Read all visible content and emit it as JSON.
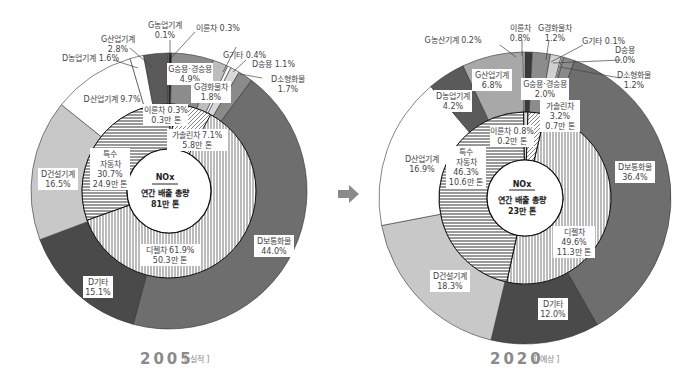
{
  "chart_data": [
    {
      "type": "pie",
      "subtype": "nested-donut",
      "title": "NOx 연간 배출 총량 81만 톤",
      "year_label": "2005",
      "year_tag": "[ 실적 ]",
      "center": {
        "pollutant": "NOx",
        "line1": "연간 배출 총량",
        "line2": "81만 톤"
      },
      "inner_ring": [
        {
          "name": "디젤차",
          "percent": 61.9,
          "amount": "50.3만 톤",
          "pattern": "vertical-stripes"
        },
        {
          "name": "특수 자동차",
          "percent": 30.7,
          "amount": "24.9만 톤",
          "pattern": "horizontal-stripes"
        },
        {
          "name": "이륜차",
          "percent": 0.3,
          "amount": "0.3만 톤",
          "pattern": "dots"
        },
        {
          "name": "가솔린차",
          "percent": 7.1,
          "amount": "5.8만 톤",
          "pattern": "diagonal-stripes"
        }
      ],
      "outer_ring": [
        {
          "name": "D보통화물",
          "percent": 44.0,
          "color": "#6e6e6e"
        },
        {
          "name": "D기타",
          "percent": 15.1,
          "color": "#4a4a4a"
        },
        {
          "name": "D건설기계",
          "percent": 16.5,
          "color": "#c8c8c8"
        },
        {
          "name": "D산업기계",
          "percent": 9.7,
          "color": "#ffffff"
        },
        {
          "name": "D농업기계",
          "percent": 1.6,
          "color": "#ffffff"
        },
        {
          "name": "G산업기계",
          "percent": 2.8,
          "color": "#5a5a5a"
        },
        {
          "name": "G농업기계",
          "percent": 0.1,
          "color": "#a0a0a0"
        },
        {
          "name": "이륜차",
          "percent": 0.3,
          "color": "#222222"
        },
        {
          "name": "G승용·경승용",
          "percent": 4.9,
          "color": "#8c8c8c"
        },
        {
          "name": "G경화물차",
          "percent": 1.8,
          "color": "#bdbdbd"
        },
        {
          "name": "G기타",
          "percent": 0.4,
          "color": "#ffffff"
        },
        {
          "name": "D승용",
          "percent": 1.1,
          "color": "#d8d8d8"
        },
        {
          "name": "D소형화물",
          "percent": 1.7,
          "color": "#8a8a8a"
        }
      ]
    },
    {
      "type": "pie",
      "subtype": "nested-donut",
      "title": "NOx 연간 배출 총량 23만 톤",
      "year_label": "2020",
      "year_tag": "[ 예상 ]",
      "center": {
        "pollutant": "NOx",
        "line1": "연간 배출 총량",
        "line2": "23만 톤"
      },
      "inner_ring": [
        {
          "name": "디젤차",
          "percent": 49.6,
          "amount": "11.3만 톤",
          "pattern": "vertical-stripes"
        },
        {
          "name": "특수 자동차",
          "percent": 46.3,
          "amount": "10.6만 톤",
          "pattern": "horizontal-stripes"
        },
        {
          "name": "이륜차",
          "percent": 0.8,
          "amount": "0.2만 톤",
          "pattern": "dots"
        },
        {
          "name": "가솔린차",
          "percent": 3.2,
          "amount": "0.7만 톤",
          "pattern": "diagonal-stripes"
        }
      ],
      "outer_ring": [
        {
          "name": "D보통화물",
          "percent": 36.4,
          "color": "#6e6e6e"
        },
        {
          "name": "D기타",
          "percent": 12.0,
          "color": "#4a4a4a"
        },
        {
          "name": "D건설기계",
          "percent": 18.3,
          "color": "#c8c8c8"
        },
        {
          "name": "D산업기계",
          "percent": 16.9,
          "color": "#ffffff"
        },
        {
          "name": "D농업기계",
          "percent": 4.2,
          "color": "#5a5a5a"
        },
        {
          "name": "G산업기계",
          "percent": 6.8,
          "color": "#a8a8a8"
        },
        {
          "name": "G농산기계",
          "percent": 0.2,
          "color": "#ffffff"
        },
        {
          "name": "이륜차",
          "percent": 0.8,
          "color": "#3a3a3a"
        },
        {
          "name": "G승용·경승용",
          "percent": 2.0,
          "color": "#8c8c8c"
        },
        {
          "name": "G경화물차",
          "percent": 1.2,
          "color": "#d0d0d0"
        },
        {
          "name": "G기타",
          "percent": 0.1,
          "color": "#ffffff"
        },
        {
          "name": "D승용",
          "percent": 0.0,
          "color": "#d8d8d8"
        },
        {
          "name": "D소형화물",
          "percent": 1.2,
          "color": "#8a8a8a"
        }
      ]
    }
  ],
  "labels2005": {
    "g_agri": [
      "G농업기계",
      "0.1%"
    ],
    "bike_top": "이륜차 0.3%",
    "g_ind": [
      "G산업기계",
      "2.8%"
    ],
    "d_agri": "D농업기계 1.6%",
    "g_car": [
      "G승용·경승용",
      "4.9%"
    ],
    "g_etc": "G기타 0.4%",
    "d_car": "D승용 1.1%",
    "d_small": [
      "D소형화물",
      "1.7%"
    ],
    "g_light": [
      "G경화물차",
      "1.8%"
    ],
    "d_ind": "D산업기계 9.7%",
    "bike_in": [
      "이륜차 0.3%",
      "0.3만 톤"
    ],
    "gas_in": [
      "가솔린차 7.1%",
      "5.8만 톤"
    ],
    "special": [
      "특수",
      "자동차",
      "30.7%",
      "24.9만 톤"
    ],
    "d_cons": [
      "D건설기계",
      "16.5%"
    ],
    "diesel": [
      "디젤차 61.9%",
      "50.3만 톤"
    ],
    "d_truck": [
      "D보통화물",
      "44.0%"
    ],
    "d_etc": [
      "D기타",
      "15.1%"
    ],
    "center": [
      "NOx",
      "연간 배출 총량",
      "81만 톤"
    ],
    "year": "2005",
    "tag": "[ 실적 ]"
  },
  "labels2020": {
    "g_agri": "G농산기계 0.2%",
    "bike_top": [
      "이륜차",
      "0.8%"
    ],
    "g_light": [
      "G경화물차",
      "1.2%"
    ],
    "g_etc": "G기타 0.1%",
    "d_car": [
      "D승용",
      "0.0%"
    ],
    "d_small": [
      "D소형화물",
      "1.2%"
    ],
    "g_ind": [
      "G산업기계",
      "6.8%"
    ],
    "g_car": [
      "G승용·경승용",
      "2.0%"
    ],
    "d_agri": [
      "D농업기계",
      "4.2%"
    ],
    "gas_in": [
      "가솔린차",
      "3.2%",
      "0.7만 톤"
    ],
    "bike_in": [
      "이륜차 0.8%",
      "0.2만 톤"
    ],
    "d_ind": [
      "D산업기계",
      "16.9%"
    ],
    "special": [
      "특수",
      "자동차",
      "46.3%",
      "10.6만 톤"
    ],
    "d_truck": [
      "D보통화물",
      "36.4%"
    ],
    "diesel": [
      "디젤차",
      "49.6%",
      "11.3만 톤"
    ],
    "d_cons": [
      "D건설기계",
      "18.3%"
    ],
    "d_etc": [
      "D기타",
      "12.0%"
    ],
    "center": [
      "NOx",
      "연간 배출 총량",
      "23만 톤"
    ],
    "year": "2020",
    "tag": "[ 예상 ]"
  },
  "arrow_color": "#8a8a8a"
}
